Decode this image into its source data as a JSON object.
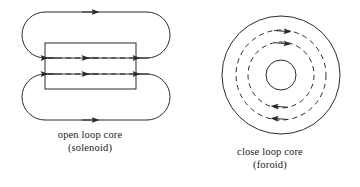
{
  "figure": {
    "width": 360,
    "height": 187,
    "background_color": "#ffffff",
    "line_color": "#2b2b2b",
    "text_color": "#222222"
  },
  "panels": [
    {
      "id": "solenoid",
      "caption_line1": "open loop core",
      "caption_line2": "(solenoid)",
      "core_shape_name": "rectangle",
      "field_line_style": "dashed-inside-solid-outside",
      "inner_field_direction": "leftward",
      "outer_loop_direction": "rightward",
      "inner_field_line_count": 2,
      "outer_loop_count": 2
    },
    {
      "id": "toroid",
      "caption_line1": "close loop core",
      "caption_line2": "(foroid)",
      "core_shape_name": "annulus",
      "field_line_style": "dashed-concentric-circles",
      "field_direction": "clockwise",
      "dashed_circle_count": 2,
      "solid_circle_count": 2
    }
  ]
}
